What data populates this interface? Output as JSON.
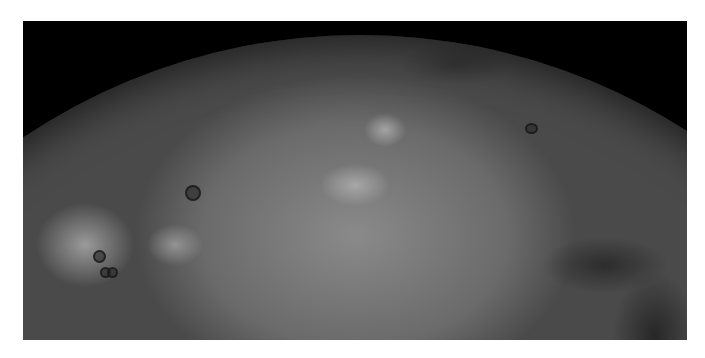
{
  "image": {
    "subject": "planetary-surface",
    "description": "Cratered grey planetary/moon surface partial disk against black space",
    "background_color": "#000000",
    "frame_color": "#ffffff"
  }
}
